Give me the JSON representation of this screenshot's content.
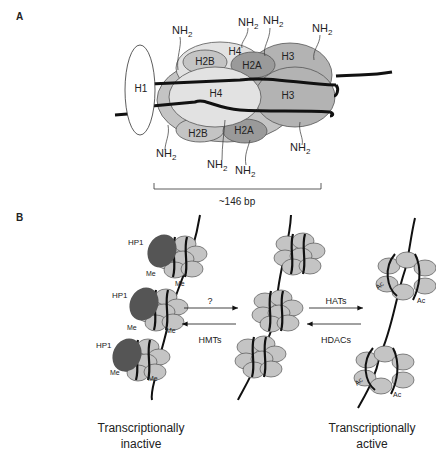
{
  "panel_a": {
    "label": "A",
    "histones": {
      "h1": "H1",
      "h4_top": "H4",
      "h2b_top": "H2B",
      "h2a_top": "H2A",
      "h3_top": "H3",
      "h4_front": "H4",
      "h3_front": "H3",
      "h2b_bottom": "H2B",
      "h2a_bottom": "H2A"
    },
    "tail_label": "NH",
    "tail_sub": "2",
    "scale_label": "~146 bp"
  },
  "panel_b": {
    "label": "B",
    "hp1": "HP1",
    "me": "Me",
    "ac": "Ac",
    "arrow_left_top": "?",
    "arrow_left_bottom": "HMTs",
    "arrow_right_top": "HATs",
    "arrow_right_bottom": "HDACs",
    "caption_left_line1": "Transcriptionally",
    "caption_left_line2": "inactive",
    "caption_right_line1": "Transcriptionally",
    "caption_right_line2": "active"
  },
  "colors": {
    "light": "#e2e2e2",
    "mid": "#c4c4c4",
    "dark": "#9a9a9a",
    "hp1": "#555555",
    "dna": "#111111"
  }
}
